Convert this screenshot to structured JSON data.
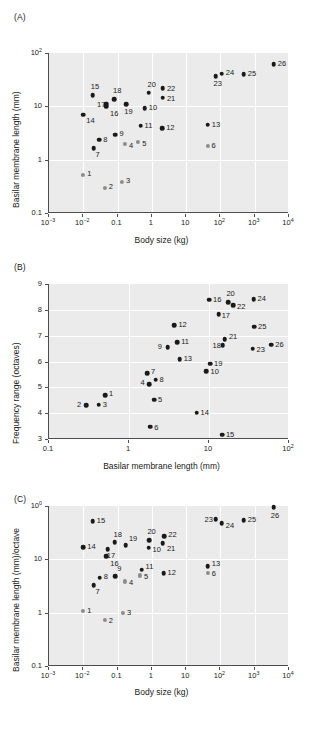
{
  "figure": {
    "panels": [
      "A",
      "B",
      "C"
    ]
  },
  "panelA": {
    "letter": "(A)",
    "xlabel": "Body size (kg)",
    "ylabel": "Basilar membrane length (mm)",
    "xticklabels": [
      "10−3",
      "10−2",
      "0.1",
      "1",
      "10",
      "10²",
      "10³",
      "10⁴"
    ],
    "yticklabels": [
      "0.1",
      "1",
      "10",
      "10²"
    ]
  },
  "panelB": {
    "letter": "(B)",
    "xlabel": "Basilar membrane length (mm)",
    "ylabel": "Frequency range (octaves)",
    "xticklabels": [
      "0.1",
      "1",
      "10",
      "10²"
    ],
    "yticklabels": [
      "3",
      "4",
      "5",
      "6",
      "7",
      "8",
      "9"
    ]
  },
  "panelC": {
    "letter": "(C)",
    "xlabel": "Body size (kg)",
    "ylabel": "Basilar membrane length (mm)/octave",
    "xticklabels": [
      "10−3",
      "10−2",
      "0.1",
      "1",
      "10",
      "10²",
      "10³",
      "10⁴"
    ],
    "yticklabels": [
      "0.1",
      "1",
      "10",
      "100"
    ]
  },
  "chart_data": [
    {
      "type": "scatter",
      "panel": "A",
      "title": "",
      "xlabel": "Body size (kg)",
      "ylabel": "Basilar membrane length (mm)",
      "xscale": "log",
      "yscale": "log",
      "xlim": [
        0.001,
        10000
      ],
      "ylim": [
        0.1,
        100
      ],
      "xticks": [
        0.001,
        0.01,
        0.1,
        1,
        10,
        100,
        1000,
        10000
      ],
      "yticks": [
        0.1,
        1,
        10,
        100
      ],
      "grid": true,
      "legend": "none",
      "points": [
        {
          "label": "1",
          "x": 0.01,
          "y": 0.52,
          "color": "gray",
          "lx": 4,
          "ly": -1
        },
        {
          "label": "2",
          "x": 0.042,
          "y": 0.3,
          "color": "gray",
          "lx": 4,
          "ly": -1
        },
        {
          "label": "3",
          "x": 0.135,
          "y": 0.38,
          "color": "gray",
          "lx": 4,
          "ly": -1
        },
        {
          "label": "4",
          "x": 0.165,
          "y": 1.95,
          "color": "gray",
          "lx": 4,
          "ly": 2
        },
        {
          "label": "5",
          "x": 0.4,
          "y": 2.15,
          "color": "gray",
          "lx": 4,
          "ly": 2
        },
        {
          "label": "6",
          "x": 42,
          "y": 1.8,
          "color": "gray",
          "lx": 4,
          "ly": 0
        },
        {
          "label": "7",
          "x": 0.02,
          "y": 1.65,
          "color": "black",
          "lx": 2,
          "ly": 7
        },
        {
          "label": "8",
          "x": 0.029,
          "y": 2.35,
          "color": "black",
          "lx": 4,
          "ly": 0
        },
        {
          "label": "9",
          "x": 0.087,
          "y": 2.95,
          "color": "black",
          "lx": 4,
          "ly": -1
        },
        {
          "label": "10",
          "x": 0.62,
          "y": 9.3,
          "color": "black",
          "lx": 4,
          "ly": 0
        },
        {
          "label": "11",
          "x": 0.47,
          "y": 4.3,
          "color": "black",
          "lx": 4,
          "ly": 0
        },
        {
          "label": "12",
          "x": 2.0,
          "y": 3.9,
          "color": "black",
          "lx": 4,
          "ly": 0
        },
        {
          "label": "13",
          "x": 43,
          "y": 4.5,
          "color": "black",
          "lx": 4,
          "ly": 0
        },
        {
          "label": "14",
          "x": 0.01,
          "y": 7.0,
          "color": "black",
          "lx": 3,
          "ly": 6
        },
        {
          "label": "15",
          "x": 0.019,
          "y": 16.0,
          "color": "black",
          "lx": -2,
          "ly": -8
        },
        {
          "label": "16",
          "x": 0.046,
          "y": 10.0,
          "color": "black",
          "lx": 0,
          "ly": 8
        },
        {
          "label": "17",
          "x": 0.046,
          "y": 11.3,
          "color": "black",
          "lx": -9,
          "ly": 1
        },
        {
          "label": "18",
          "x": 0.079,
          "y": 13.5,
          "color": "black",
          "lx": -1,
          "ly": -8
        },
        {
          "label": "19",
          "x": 0.18,
          "y": 11.0,
          "color": "black",
          "lx": -2,
          "ly": 8
        },
        {
          "label": "20",
          "x": 0.8,
          "y": 18.0,
          "color": "black",
          "lx": -1,
          "ly": -8
        },
        {
          "label": "21",
          "x": 2.1,
          "y": 14.5,
          "color": "black",
          "lx": 4,
          "ly": 1
        },
        {
          "label": "22",
          "x": 2.1,
          "y": 22.0,
          "color": "black",
          "lx": 4,
          "ly": 1
        },
        {
          "label": "23",
          "x": 72,
          "y": 37.0,
          "color": "black",
          "lx": -2,
          "ly": 8
        },
        {
          "label": "24",
          "x": 110,
          "y": 41.0,
          "color": "black",
          "lx": 4,
          "ly": -1
        },
        {
          "label": "25",
          "x": 480,
          "y": 40.0,
          "color": "black",
          "lx": 4,
          "ly": 0
        },
        {
          "label": "26",
          "x": 3600,
          "y": 62.0,
          "color": "black",
          "lx": 4,
          "ly": 0
        }
      ]
    },
    {
      "type": "scatter",
      "panel": "B",
      "title": "",
      "xlabel": "Basilar membrane length (mm)",
      "ylabel": "Frequency range (octaves)",
      "xscale": "log",
      "yscale": "linear",
      "xlim": [
        0.1,
        100
      ],
      "ylim": [
        3,
        9
      ],
      "xticks": [
        0.1,
        1,
        10,
        100
      ],
      "yticks": [
        3,
        4,
        5,
        6,
        7,
        8,
        9
      ],
      "grid": true,
      "legend": "none",
      "points": [
        {
          "label": "1",
          "x": 0.5,
          "y": 4.7,
          "color": "black",
          "lx": 4,
          "ly": -1
        },
        {
          "label": "2",
          "x": 0.29,
          "y": 4.31,
          "color": "black",
          "lx": -9,
          "ly": 0
        },
        {
          "label": "3",
          "x": 0.42,
          "y": 4.33,
          "color": "black",
          "lx": 4,
          "ly": 0
        },
        {
          "label": "4",
          "x": 1.8,
          "y": 5.12,
          "color": "black",
          "lx": -9,
          "ly": -1
        },
        {
          "label": "5",
          "x": 2.05,
          "y": 4.52,
          "color": "black",
          "lx": 4,
          "ly": 0
        },
        {
          "label": "6",
          "x": 1.85,
          "y": 3.48,
          "color": "black",
          "lx": 4,
          "ly": 1
        },
        {
          "label": "7",
          "x": 1.68,
          "y": 5.55,
          "color": "black",
          "lx": 4,
          "ly": -1
        },
        {
          "label": "8",
          "x": 2.15,
          "y": 5.3,
          "color": "black",
          "lx": 4,
          "ly": 0
        },
        {
          "label": "9",
          "x": 3.05,
          "y": 6.55,
          "color": "black",
          "lx": -10,
          "ly": 0
        },
        {
          "label": "10",
          "x": 9.3,
          "y": 5.63,
          "color": "black",
          "lx": 4,
          "ly": 1
        },
        {
          "label": "11",
          "x": 4.0,
          "y": 6.74,
          "color": "black",
          "lx": 4,
          "ly": 0
        },
        {
          "label": "12",
          "x": 3.7,
          "y": 7.4,
          "color": "black",
          "lx": 4,
          "ly": 0
        },
        {
          "label": "13",
          "x": 4.3,
          "y": 6.1,
          "color": "black",
          "lx": 4,
          "ly": 0
        },
        {
          "label": "14",
          "x": 7.0,
          "y": 4.02,
          "color": "black",
          "lx": 4,
          "ly": 0
        },
        {
          "label": "15",
          "x": 14.5,
          "y": 3.17,
          "color": "black",
          "lx": 4,
          "ly": 0
        },
        {
          "label": "16",
          "x": 10.0,
          "y": 8.4,
          "color": "black",
          "lx": 4,
          "ly": 0
        },
        {
          "label": "17",
          "x": 13.2,
          "y": 7.82,
          "color": "black",
          "lx": 3,
          "ly": 2
        },
        {
          "label": "18",
          "x": 14.8,
          "y": 6.62,
          "color": "black",
          "lx": -10,
          "ly": 1
        },
        {
          "label": "19",
          "x": 10.3,
          "y": 5.92,
          "color": "black",
          "lx": 4,
          "ly": 0
        },
        {
          "label": "20",
          "x": 17.5,
          "y": 8.3,
          "color": "black",
          "lx": -2,
          "ly": -8
        },
        {
          "label": "21",
          "x": 15.8,
          "y": 6.86,
          "color": "black",
          "lx": 4,
          "ly": -2
        },
        {
          "label": "22",
          "x": 20.0,
          "y": 8.18,
          "color": "black",
          "lx": 4,
          "ly": 2
        },
        {
          "label": "23",
          "x": 35.0,
          "y": 6.5,
          "color": "black",
          "lx": 4,
          "ly": 1
        },
        {
          "label": "24",
          "x": 36.0,
          "y": 8.42,
          "color": "black",
          "lx": 4,
          "ly": 0
        },
        {
          "label": "25",
          "x": 36.5,
          "y": 7.34,
          "color": "black",
          "lx": 4,
          "ly": 0
        },
        {
          "label": "26",
          "x": 60.0,
          "y": 6.65,
          "color": "black",
          "lx": 4,
          "ly": 0
        }
      ]
    },
    {
      "type": "scatter",
      "panel": "C",
      "title": "",
      "xlabel": "Body size (kg)",
      "ylabel": "Basilar membrane length (mm)/octave",
      "xscale": "log",
      "yscale": "log",
      "xlim": [
        0.001,
        10000
      ],
      "ylim": [
        0.1,
        100
      ],
      "xticks": [
        0.001,
        0.01,
        0.1,
        1,
        10,
        100,
        1000,
        10000
      ],
      "yticks": [
        0.1,
        1,
        10,
        100
      ],
      "grid": true,
      "legend": "none",
      "points": [
        {
          "label": "1",
          "x": 0.01,
          "y": 1.08,
          "color": "gray",
          "lx": 4,
          "ly": 0
        },
        {
          "label": "2",
          "x": 0.042,
          "y": 0.73,
          "color": "gray",
          "lx": 4,
          "ly": 1
        },
        {
          "label": "3",
          "x": 0.145,
          "y": 0.98,
          "color": "gray",
          "lx": 4,
          "ly": 0
        },
        {
          "label": "4",
          "x": 0.165,
          "y": 3.85,
          "color": "gray",
          "lx": 4,
          "ly": 2
        },
        {
          "label": "5",
          "x": 0.45,
          "y": 5.0,
          "color": "gray",
          "lx": 4,
          "ly": 2
        },
        {
          "label": "6",
          "x": 43,
          "y": 5.5,
          "color": "gray",
          "lx": 4,
          "ly": 1
        },
        {
          "label": "7",
          "x": 0.02,
          "y": 3.3,
          "color": "black",
          "lx": 2,
          "ly": 7
        },
        {
          "label": "8",
          "x": 0.03,
          "y": 4.55,
          "color": "black",
          "lx": 4,
          "ly": -1
        },
        {
          "label": "9",
          "x": 0.085,
          "y": 4.85,
          "color": "black",
          "lx": 2,
          "ly": -7
        },
        {
          "label": "10",
          "x": 0.8,
          "y": 16.5,
          "color": "black",
          "lx": 4,
          "ly": 2
        },
        {
          "label": "11",
          "x": 0.5,
          "y": 6.4,
          "color": "black",
          "lx": 4,
          "ly": -3
        },
        {
          "label": "12",
          "x": 2.2,
          "y": 5.5,
          "color": "black",
          "lx": 4,
          "ly": 0
        },
        {
          "label": "13",
          "x": 43,
          "y": 7.5,
          "color": "black",
          "lx": 4,
          "ly": -2
        },
        {
          "label": "14",
          "x": 0.01,
          "y": 17.0,
          "color": "black",
          "lx": 4,
          "ly": 0
        },
        {
          "label": "15",
          "x": 0.019,
          "y": 52.0,
          "color": "black",
          "lx": 4,
          "ly": 0
        },
        {
          "label": "16",
          "x": 0.047,
          "y": 11.5,
          "color": "black",
          "lx": 0,
          "ly": 8
        },
        {
          "label": "17",
          "x": 0.052,
          "y": 15.5,
          "color": "black",
          "lx": -1,
          "ly": 7
        },
        {
          "label": "18",
          "x": 0.082,
          "y": 21.0,
          "color": "black",
          "lx": -1,
          "ly": -7
        },
        {
          "label": "19",
          "x": 0.175,
          "y": 18.5,
          "color": "black",
          "lx": 3,
          "ly": -6
        },
        {
          "label": "20",
          "x": 0.85,
          "y": 23.0,
          "color": "black",
          "lx": -2,
          "ly": -8
        },
        {
          "label": "21",
          "x": 2.1,
          "y": 20.0,
          "color": "black",
          "lx": 4,
          "ly": 6
        },
        {
          "label": "22",
          "x": 2.3,
          "y": 27.0,
          "color": "black",
          "lx": 4,
          "ly": -1
        },
        {
          "label": "23",
          "x": 72,
          "y": 57.0,
          "color": "black",
          "lx": -11,
          "ly": 1
        },
        {
          "label": "24",
          "x": 110,
          "y": 48.0,
          "color": "black",
          "lx": 4,
          "ly": 3
        },
        {
          "label": "25",
          "x": 480,
          "y": 54.0,
          "color": "black",
          "lx": 4,
          "ly": 0
        },
        {
          "label": "26",
          "x": 3600,
          "y": 95.0,
          "color": "black",
          "lx": -3,
          "ly": 9
        }
      ]
    }
  ]
}
